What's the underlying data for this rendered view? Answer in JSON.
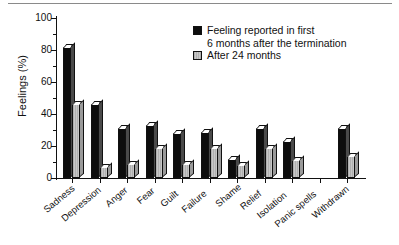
{
  "chart_data": {
    "type": "bar",
    "title": "",
    "xlabel": "",
    "ylabel": "Feelings (%)",
    "ylim": [
      0,
      100
    ],
    "ytick_labels": [
      "100",
      "80",
      "60",
      "40",
      "20",
      "0"
    ],
    "ytick_values": [
      100,
      80,
      60,
      40,
      20,
      0
    ],
    "minor_tick_step": 10,
    "grid": false,
    "legend_position": "top-right",
    "categories": [
      "Sadness",
      "Depression",
      "Anger",
      "Fear",
      "Guilt",
      "Failure",
      "Shame",
      "Relief",
      "Isolation",
      "Panic spells",
      "Withdrawn"
    ],
    "series": [
      {
        "name": "Feeling reported in first 6 months after the termination",
        "color": "#0d0d0d",
        "values": [
          82,
          46,
          31,
          33,
          28,
          29,
          12,
          31,
          23,
          0,
          31
        ]
      },
      {
        "name": "After 24 months",
        "color": "#bdbdbd",
        "values": [
          46,
          7,
          9,
          19,
          9,
          19,
          8,
          19,
          11,
          0,
          14
        ]
      }
    ]
  },
  "legend": {
    "entries": [
      {
        "swatch": "black-swatch",
        "line1": "Feeling reported in first",
        "line2": "6 months after the termination"
      },
      {
        "swatch": "gray-swatch",
        "line1": "After 24 months",
        "line2": ""
      }
    ]
  }
}
